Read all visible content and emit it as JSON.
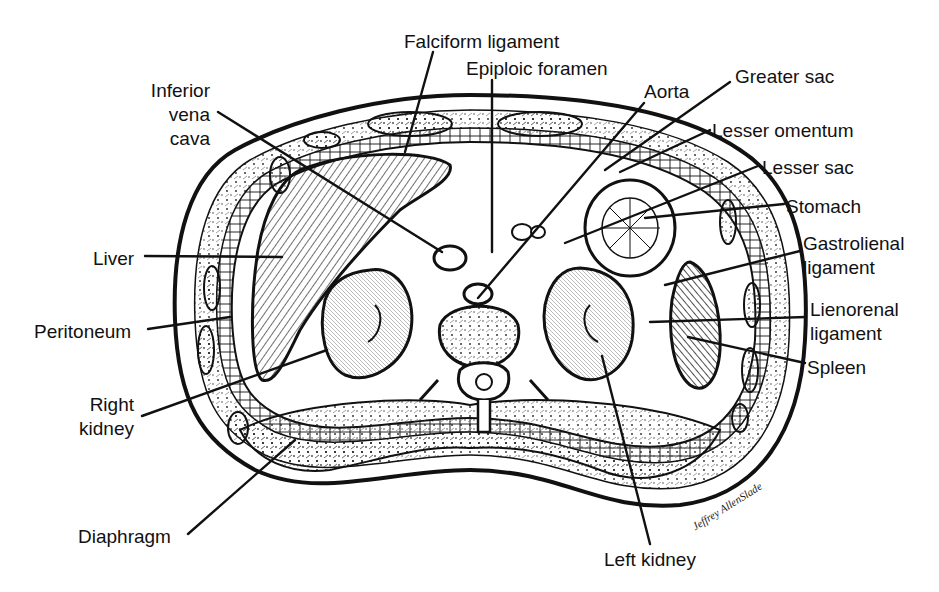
{
  "figure": {
    "colors": {
      "ink": "#111111",
      "background": "#ffffff",
      "dark_tissue": "#333333"
    }
  },
  "labels": [
    {
      "id": "falciform-ligament",
      "text": "Falciform ligament",
      "x": 404,
      "y": 30,
      "align": "left"
    },
    {
      "id": "epiploic-foramen",
      "text": "Epiploic foramen",
      "x": 466,
      "y": 57,
      "align": "left"
    },
    {
      "id": "inferior-vena-cava-1",
      "text": "Inferior",
      "x": 140,
      "y": 79,
      "align": "right",
      "w": 70
    },
    {
      "id": "inferior-vena-cava-2",
      "text": "vena",
      "x": 140,
      "y": 103,
      "align": "right",
      "w": 70
    },
    {
      "id": "inferior-vena-cava-3",
      "text": "cava",
      "x": 140,
      "y": 127,
      "align": "right",
      "w": 70
    },
    {
      "id": "aorta",
      "text": "Aorta",
      "x": 644,
      "y": 80,
      "align": "left"
    },
    {
      "id": "greater-sac",
      "text": "Greater sac",
      "x": 735,
      "y": 65,
      "align": "left"
    },
    {
      "id": "lesser-omentum",
      "text": "Lesser omentum",
      "x": 712,
      "y": 119,
      "align": "left"
    },
    {
      "id": "lesser-sac",
      "text": "Lesser sac",
      "x": 762,
      "y": 156,
      "align": "left"
    },
    {
      "id": "stomach",
      "text": "Stomach",
      "x": 786,
      "y": 195,
      "align": "left"
    },
    {
      "id": "gastrolienal-ligament-1",
      "text": "Gastrolienal",
      "x": 803,
      "y": 232,
      "align": "left"
    },
    {
      "id": "gastrolienal-ligament-2",
      "text": "ligament",
      "x": 803,
      "y": 256,
      "align": "left"
    },
    {
      "id": "lienorenal-ligament-1",
      "text": "Lienorenal",
      "x": 810,
      "y": 298,
      "align": "left"
    },
    {
      "id": "lienorenal-ligament-2",
      "text": "ligament",
      "x": 810,
      "y": 322,
      "align": "left"
    },
    {
      "id": "spleen",
      "text": "Spleen",
      "x": 807,
      "y": 356,
      "align": "left"
    },
    {
      "id": "liver",
      "text": "Liver",
      "x": 93,
      "y": 247,
      "align": "left"
    },
    {
      "id": "peritoneum",
      "text": "Peritoneum",
      "x": 34,
      "y": 320,
      "align": "left"
    },
    {
      "id": "right-kidney-1",
      "text": "Right",
      "x": 70,
      "y": 393,
      "align": "right",
      "w": 64
    },
    {
      "id": "right-kidney-2",
      "text": "kidney",
      "x": 70,
      "y": 417,
      "align": "right",
      "w": 64
    },
    {
      "id": "diaphragm",
      "text": "Diaphragm",
      "x": 78,
      "y": 525,
      "align": "left"
    },
    {
      "id": "left-kidney",
      "text": "Left kidney",
      "x": 604,
      "y": 548,
      "align": "left"
    }
  ],
  "leaders": [
    {
      "id": "falciform-ligament-leader",
      "x1": 433,
      "y1": 52,
      "x2": 405,
      "y2": 152
    },
    {
      "id": "epiploic-foramen-leader",
      "x1": 492,
      "y1": 80,
      "x2": 492,
      "y2": 252
    },
    {
      "id": "inferior-vena-cava-leader",
      "x1": 218,
      "y1": 112,
      "x2": 442,
      "y2": 252
    },
    {
      "id": "aorta-leader",
      "x1": 644,
      "y1": 103,
      "x2": 478,
      "y2": 298
    },
    {
      "id": "greater-sac-leader",
      "x1": 730,
      "y1": 82,
      "x2": 605,
      "y2": 170
    },
    {
      "id": "lesser-omentum-leader",
      "x1": 710,
      "y1": 130,
      "x2": 620,
      "y2": 172
    },
    {
      "id": "lesser-sac-leader",
      "x1": 758,
      "y1": 166,
      "x2": 565,
      "y2": 243
    },
    {
      "id": "stomach-leader",
      "x1": 784,
      "y1": 204,
      "x2": 645,
      "y2": 218
    },
    {
      "id": "gastrolienal-ligament-leader",
      "x1": 800,
      "y1": 251,
      "x2": 665,
      "y2": 285
    },
    {
      "id": "lienorenal-ligament-leader",
      "x1": 806,
      "y1": 317,
      "x2": 650,
      "y2": 322
    },
    {
      "id": "spleen-leader",
      "x1": 805,
      "y1": 363,
      "x2": 688,
      "y2": 337
    },
    {
      "id": "liver-leader",
      "x1": 145,
      "y1": 256,
      "x2": 282,
      "y2": 257
    },
    {
      "id": "peritoneum-leader",
      "x1": 148,
      "y1": 329,
      "x2": 230,
      "y2": 317
    },
    {
      "id": "right-kidney-leader",
      "x1": 142,
      "y1": 416,
      "x2": 327,
      "y2": 350
    },
    {
      "id": "diaphragm-leader",
      "x1": 188,
      "y1": 534,
      "x2": 295,
      "y2": 440
    },
    {
      "id": "left-kidney-leader",
      "x1": 650,
      "y1": 544,
      "x2": 602,
      "y2": 356
    }
  ],
  "signature": {
    "text": "Jeffrey AllenSlade",
    "x": 690,
    "y": 522
  }
}
